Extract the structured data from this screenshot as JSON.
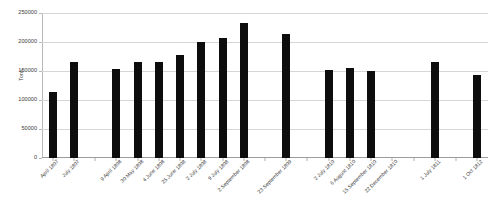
{
  "chart_data": {
    "type": "bar",
    "title": "",
    "xlabel": "",
    "ylabel": "Tons",
    "ylim": [
      0,
      250000
    ],
    "yticks": [
      0,
      50000,
      100000,
      150000,
      200000,
      250000
    ],
    "ytick_labels": [
      "0",
      "50000",
      "100000",
      "150000",
      "200000",
      "250000"
    ],
    "grid": true,
    "legend": false,
    "bar_color": "#0d0d0d",
    "gridline_color": "#d6d6d6",
    "axis_color": "#b9b9b9",
    "categories": [
      "April 1807",
      "July 1807",
      "",
      "9 April 1808",
      "30 May 1808",
      "4 June 1808",
      "25 June 1808",
      "2 July 1808",
      "9 July 1808",
      "2 September 1808",
      "",
      "23 September 1809",
      "",
      "2 July 1810",
      "6 August 1810",
      "15 September 1810",
      "22 December 1810",
      "",
      "1 July 1811",
      "",
      "1 Oct 1812"
    ],
    "values": [
      113000,
      166000,
      null,
      154000,
      165000,
      165000,
      178000,
      200000,
      207000,
      233000,
      null,
      213000,
      null,
      151000,
      155000,
      150000,
      null,
      null,
      166000,
      null,
      143000
    ]
  }
}
